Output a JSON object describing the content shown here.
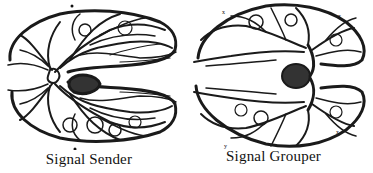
{
  "figure": {
    "panels": [
      {
        "caption": "Signal Sender",
        "illustration": "dendritic-network-left"
      },
      {
        "caption": "Signal Grouper",
        "illustration": "dendritic-network-right"
      }
    ],
    "colors": {
      "ink": "#111111",
      "background": "#ffffff"
    }
  }
}
